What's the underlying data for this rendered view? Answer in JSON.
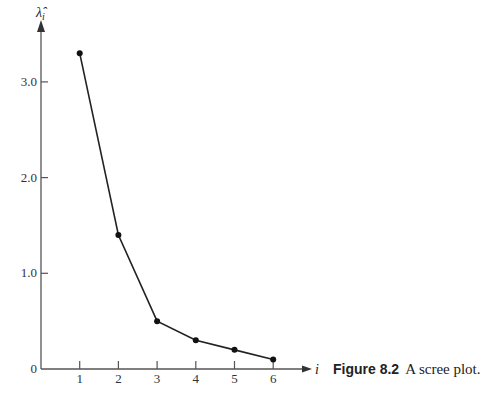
{
  "chart_data": {
    "type": "line",
    "title": "",
    "xlabel": "i",
    "ylabel": "λ̂_i",
    "x": [
      1,
      2,
      3,
      4,
      5,
      6
    ],
    "values": [
      3.3,
      1.4,
      0.5,
      0.3,
      0.2,
      0.1
    ],
    "x_ticks": [
      "1",
      "2",
      "3",
      "4",
      "5",
      "6"
    ],
    "y_ticks": [
      "0",
      "1.0",
      "2.0",
      "3.0"
    ],
    "ylim": [
      0,
      3.6
    ],
    "xlim": [
      0,
      7
    ],
    "grid": false,
    "markers": true,
    "line_color": "#222222"
  },
  "caption": {
    "figure_label": "Figure 8.2",
    "text": "A scree plot."
  }
}
